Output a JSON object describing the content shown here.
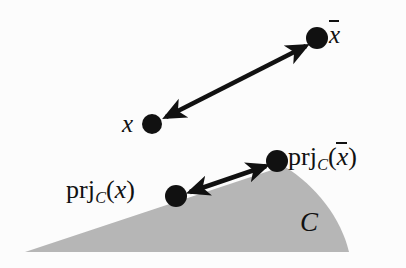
{
  "figure": {
    "kind": "mathematical-diagram",
    "background_color": "#fcfcfc",
    "set_fill_color": "#b6b6b6",
    "ink_color": "#111111",
    "width": 406,
    "height": 268
  },
  "labels": {
    "x": "x",
    "x_bar_base": "x",
    "prj_operator": "prj",
    "prj_subscript": "C",
    "paren_open": "(",
    "paren_close": ")",
    "set_name": "C"
  },
  "points": [
    {
      "id": "x",
      "name": "point-x",
      "cx": 152,
      "cy": 124,
      "r": 10
    },
    {
      "id": "x-bar",
      "name": "point-x-bar",
      "cx": 317,
      "cy": 38,
      "r": 11
    },
    {
      "id": "prj-x",
      "name": "point-prj-x",
      "cx": 176,
      "cy": 196,
      "r": 11
    },
    {
      "id": "prj-x-bar",
      "name": "point-prj-x-bar",
      "cx": 277,
      "cy": 161,
      "r": 11
    }
  ],
  "arrows": [
    {
      "id": "arrow-x-to-xbar",
      "from": [
        166,
        117
      ],
      "to": [
        306,
        46
      ],
      "double_headed": true
    },
    {
      "id": "arrow-prjx-to-prjxbar",
      "from": [
        190,
        192
      ],
      "to": [
        266,
        166
      ],
      "double_headed": true
    }
  ],
  "set_region": {
    "name": "convex-set-C",
    "apex": [
      284,
      166
    ],
    "bottom_left_tip": [
      25,
      252
    ],
    "bottom_right": [
      349,
      252
    ],
    "right_edge_curved": true
  }
}
